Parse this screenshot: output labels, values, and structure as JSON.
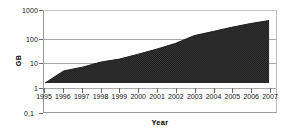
{
  "chart_data": {
    "type": "area",
    "title": "",
    "xlabel": "Year",
    "ylabel": "GB",
    "yscale": "log",
    "ylim": [
      0.1,
      1000
    ],
    "xlim": [
      1995,
      2007
    ],
    "grid": true,
    "legend": "none",
    "y_ticks": [
      "1000",
      "100",
      "10",
      "1",
      "0,1"
    ],
    "y_tick_values": [
      1000,
      100,
      10,
      1,
      0.1
    ],
    "categories": [
      "1995",
      "1996",
      "1997",
      "1998",
      "1999",
      "2000",
      "2001",
      "2002",
      "2003",
      "2004",
      "2005",
      "2006",
      "2007"
    ],
    "x": [
      1995,
      1996,
      1997,
      1998,
      1999,
      2000,
      2001,
      2002,
      2003,
      2004,
      2005,
      2006,
      2007
    ],
    "values": [
      1,
      3.2,
      4.6,
      7.5,
      10,
      16,
      26,
      45,
      95,
      140,
      210,
      300,
      400
    ],
    "series": [
      {
        "name": "GB",
        "values": [
          1,
          3.2,
          4.6,
          7.5,
          10,
          16,
          26,
          45,
          95,
          140,
          210,
          300,
          400
        ]
      }
    ],
    "fill_color": "#3a3a3a",
    "line_color": "#1a1a1a",
    "grid_color": "#a8a8a8",
    "baseline": 1
  }
}
